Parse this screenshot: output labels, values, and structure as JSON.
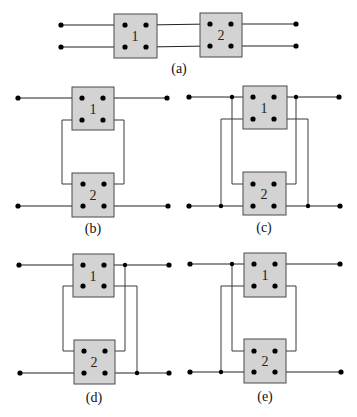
{
  "figure": {
    "colors": {
      "box_fill": "#d3d3d3",
      "box_stroke": "#4a4a4a",
      "wire": "#3a3a3a",
      "terminal": "#000000",
      "background": "#ffffff"
    },
    "panels": [
      {
        "id": "a",
        "caption": "(a)",
        "connection": "cascade",
        "networks": [
          "1",
          "2"
        ]
      },
      {
        "id": "b",
        "caption": "(b)",
        "connection": "series-series",
        "networks": [
          "1",
          "2"
        ]
      },
      {
        "id": "c",
        "caption": "(c)",
        "connection": "parallel-parallel",
        "networks": [
          "1",
          "2"
        ]
      },
      {
        "id": "d",
        "caption": "(d)",
        "connection": "series-parallel",
        "networks": [
          "1",
          "2"
        ]
      },
      {
        "id": "e",
        "caption": "(e)",
        "connection": "parallel-series",
        "networks": [
          "1",
          "2"
        ]
      }
    ]
  }
}
